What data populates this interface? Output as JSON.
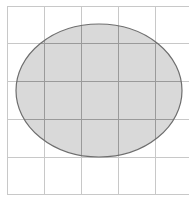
{
  "diagram": {
    "grid": {
      "vertical_lines_x": [
        7,
        44,
        81,
        118,
        155
      ],
      "horizontal_lines_y": [
        6,
        43,
        81,
        119,
        157,
        194
      ],
      "cell_size": 37,
      "line_color": "#c8c8c8",
      "extends_right_to_edge": true
    },
    "ellipse": {
      "cx": 99,
      "cy": 90.5,
      "rx": 83,
      "ry": 66.5,
      "fill": "#d9d9d9",
      "stroke": "#6e6e6e"
    },
    "colors": {
      "background": "#ffffff",
      "grid_line": "#c8c8c8",
      "ellipse_fill": "#d9d9d9",
      "ellipse_stroke": "#6e6e6e"
    }
  }
}
